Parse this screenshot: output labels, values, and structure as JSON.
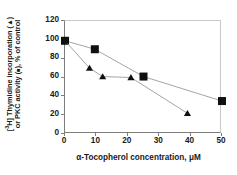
{
  "chart_data": {
    "type": "line",
    "title": "",
    "subtitle": "",
    "xlabel_parts": {
      "alpha": "α",
      "text": "-Tocopherol concentration, ",
      "micro": "μ",
      "unit": "M"
    },
    "xlabel": "α-Tocopherol concentration, μM",
    "ylabel_line1_parts": {
      "bracket_open": "[",
      "sup": "3",
      "rest": "H] Thymidine  incorporation (",
      "marker": "▲",
      "bracket_close": ")"
    },
    "ylabel_line2_parts": {
      "pre": "or PKC activity (",
      "marker": "■",
      "post": "), % of control"
    },
    "ylabel": "[3H] Thymidine incorporation (▲) or PKC activity (■), % of control",
    "xlim": [
      0,
      50
    ],
    "ylim": [
      0,
      120
    ],
    "xticks": [
      0,
      10,
      20,
      30,
      40,
      50
    ],
    "yticks": [
      0,
      20,
      40,
      60,
      80,
      100,
      120
    ],
    "xtick_labels": [
      "0",
      "10",
      "20",
      "30",
      "40",
      "50"
    ],
    "ytick_labels": [
      "0",
      "20",
      "40",
      "60",
      "80",
      "100",
      "120"
    ],
    "grid": false,
    "legend_position": "in-axis-label",
    "line_color": "#9a9a9a",
    "marker_color": "#101010",
    "axis_color": "#7d7d7d",
    "series": [
      {
        "name": "PKC activity",
        "marker": "square",
        "legend_glyph": "■",
        "x": [
          0,
          9.5,
          25,
          50
        ],
        "values": [
          99,
          90,
          61,
          35
        ]
      },
      {
        "name": "[3H] Thymidine incorporation",
        "marker": "triangle",
        "legend_glyph": "▲",
        "x": [
          0,
          7.8,
          12,
          21,
          39
        ],
        "values": [
          99,
          70,
          61,
          60,
          22
        ]
      }
    ]
  }
}
